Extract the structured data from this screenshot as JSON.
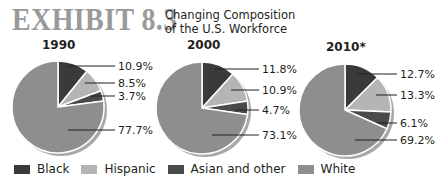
{
  "header": {
    "exhibit_label": "EXHIBIT 8.3",
    "title_line1": "Changing Composition",
    "title_line2": "of the U.S. Workforce"
  },
  "colors": {
    "Black": "#3a3a3a",
    "Hispanic": "#b5b5b5",
    "Asian and other": "#4a4a4a",
    "White": "#8e8e8e",
    "exhibit_text": "#9a9a9a"
  },
  "legend": [
    {
      "label": "Black",
      "color": "#3a3a3a"
    },
    {
      "label": "Hispanic",
      "color": "#b5b5b5"
    },
    {
      "label": "Asian and other",
      "color": "#4a4a4a"
    },
    {
      "label": "White",
      "color": "#8e8e8e"
    }
  ],
  "chart_data": [
    {
      "type": "pie",
      "title": "1990",
      "categories": [
        "Black",
        "Hispanic",
        "Asian and other",
        "White"
      ],
      "values": [
        10.9,
        8.5,
        3.7,
        77.7
      ],
      "labels": [
        "10.9%",
        "8.5%",
        "3.7%",
        "77.7%"
      ]
    },
    {
      "type": "pie",
      "title": "2000",
      "categories": [
        "Black",
        "Hispanic",
        "Asian and other",
        "White"
      ],
      "values": [
        11.8,
        10.9,
        4.7,
        73.1
      ],
      "labels": [
        "11.8%",
        "10.9%",
        "4.7%",
        "73.1%"
      ]
    },
    {
      "type": "pie",
      "title": "2010*",
      "categories": [
        "Black",
        "Hispanic",
        "Asian and other",
        "White"
      ],
      "values": [
        12.7,
        13.3,
        6.1,
        69.2
      ],
      "labels": [
        "12.7%",
        "13.3%",
        "6.1%",
        "69.2%"
      ]
    }
  ]
}
